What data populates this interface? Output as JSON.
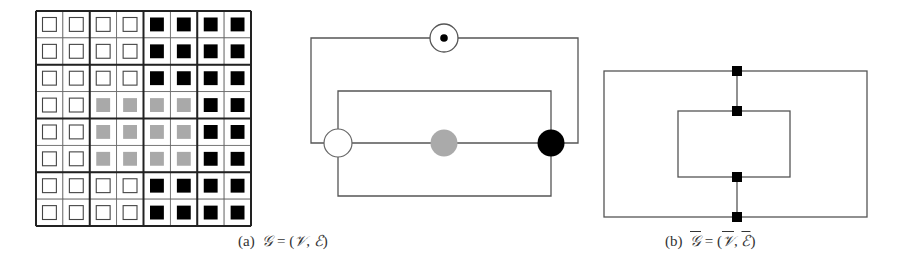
{
  "figure": {
    "panel_a": {
      "grid": {
        "rows": 8,
        "cols": 8,
        "block_size": 2,
        "cells": [
          [
            "W",
            "W",
            "W",
            "W",
            "B",
            "B",
            "B",
            "B"
          ],
          [
            "W",
            "W",
            "W",
            "W",
            "B",
            "B",
            "B",
            "B"
          ],
          [
            "W",
            "W",
            "W",
            "W",
            "B",
            "B",
            "B",
            "B"
          ],
          [
            "W",
            "W",
            "G",
            "G",
            "G",
            "G",
            "B",
            "B"
          ],
          [
            "W",
            "W",
            "G",
            "G",
            "G",
            "G",
            "B",
            "B"
          ],
          [
            "W",
            "W",
            "G",
            "G",
            "G",
            "G",
            "B",
            "B"
          ],
          [
            "W",
            "W",
            "W",
            "W",
            "B",
            "B",
            "B",
            "B"
          ],
          [
            "W",
            "W",
            "W",
            "W",
            "B",
            "B",
            "B",
            "B"
          ]
        ],
        "legend": {
          "W": "white (outlined)",
          "G": "gray",
          "B": "black"
        }
      },
      "graph": {
        "nodes": [
          {
            "id": "top",
            "style": "circle-with-dot"
          },
          {
            "id": "white",
            "style": "white"
          },
          {
            "id": "gray",
            "style": "gray"
          },
          {
            "id": "black",
            "style": "black"
          }
        ],
        "edges": [
          [
            "top",
            "white"
          ],
          [
            "top",
            "black"
          ],
          [
            "white",
            "gray"
          ],
          [
            "gray",
            "black"
          ],
          [
            "white",
            "black",
            "upper-loop"
          ],
          [
            "white",
            "black",
            "lower-loop"
          ]
        ]
      },
      "caption": {
        "label": "(a)",
        "symbol_G": "𝒢",
        "equals": "=",
        "open": "(",
        "symbol_V": "𝒱",
        "comma": ",",
        "symbol_E": "ℰ",
        "close": ")"
      }
    },
    "panel_b": {
      "graph": {
        "node_count": 4,
        "node_style": "black-square",
        "description": "outer and inner rectangles joined by a vertical edge through 4 square nodes"
      },
      "caption": {
        "label": "(b)",
        "symbol_G": "𝒢",
        "equals": "=",
        "open": "(",
        "symbol_V": "𝒱",
        "comma": ",",
        "symbol_E": "ℰ",
        "close": ")"
      }
    },
    "colors": {
      "line": "#444444",
      "white_fill": "#ffffff",
      "gray_fill": "#a9a9a9",
      "black_fill": "#000000"
    }
  }
}
